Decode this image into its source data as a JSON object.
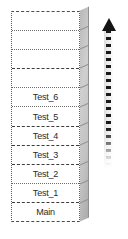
{
  "diagram": {
    "stack": {
      "name": "call-stack",
      "orientation": "vertical",
      "growth_direction": "upward",
      "cells": [
        {
          "label": "",
          "empty": true,
          "divider": "dotted"
        },
        {
          "label": "",
          "empty": true,
          "divider": "dotted"
        },
        {
          "label": "",
          "empty": true,
          "divider": "dashed"
        },
        {
          "label": "",
          "empty": true,
          "divider": "dotted"
        },
        {
          "label": "Test_6",
          "empty": false,
          "divider": "dotted"
        },
        {
          "label": "Test_5",
          "empty": false,
          "divider": "dashed"
        },
        {
          "label": "Test_4",
          "empty": false,
          "divider": "dashed"
        },
        {
          "label": "Test_3",
          "empty": false,
          "divider": "dashed"
        },
        {
          "label": "Test_2",
          "empty": false,
          "divider": "dotted"
        },
        {
          "label": "Test_1",
          "empty": false,
          "divider": "dashed"
        },
        {
          "label": "Main",
          "empty": false,
          "divider": "none"
        }
      ]
    },
    "arrow": {
      "name": "growth-direction-arrow",
      "style": "dashed",
      "points": "up",
      "color": "#141414"
    },
    "colors": {
      "cell_fill": "#ffffff",
      "cell_border": "#5a5a5a",
      "side_face": "#c2c2c2",
      "text": "#2b2b2b",
      "arrow": "#141414"
    }
  }
}
